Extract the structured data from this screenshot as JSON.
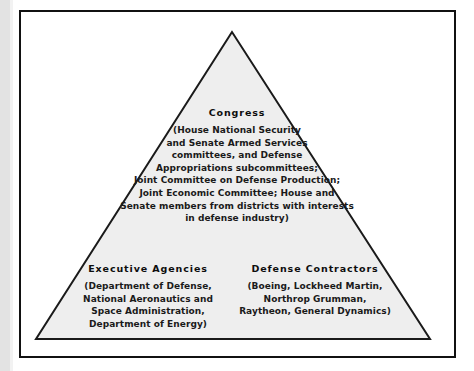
{
  "figure": {
    "type": "triangle-diagram",
    "colors": {
      "frame_border": "#111111",
      "triangle_fill": "#eeeeee",
      "triangle_stroke": "#1a1a1a",
      "page_background": "#ffffff",
      "scan_edge": "#e3e3e3",
      "text": "#111111"
    },
    "geometry": {
      "apex": [
        232,
        32
      ],
      "base_left": [
        36,
        339
      ],
      "base_right": [
        430,
        339
      ]
    }
  },
  "blocks": {
    "congress": {
      "heading": "Congress",
      "lines": [
        "(House National Security",
        "and Senate Armed Services",
        "committees, and Defense",
        "Appropriations subcommittees;",
        "Joint Committee on Defense Production;",
        "Joint Economic Committee; House and",
        "Senate members from districts with interests",
        "in defense industry)"
      ]
    },
    "executive_agencies": {
      "heading": "Executive Agencies",
      "lines": [
        "(Department of Defense,",
        "National Aeronautics and",
        "Space Administration,",
        "Department of Energy)"
      ]
    },
    "defense_contractors": {
      "heading": "Defense Contractors",
      "lines": [
        "(Boeing, Lockheed Martin,",
        "Northrop Grumman,",
        "Raytheon, General Dynamics)"
      ]
    }
  }
}
